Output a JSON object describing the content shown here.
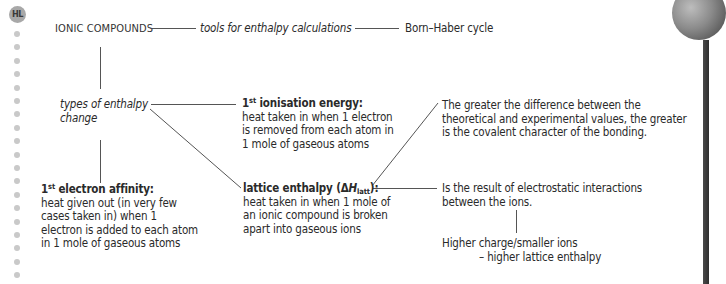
{
  "badge": {
    "label": "HL"
  },
  "margin_dots": {
    "count": 19
  },
  "diagram": {
    "root": {
      "label": "IONIC COMPOUNDS"
    },
    "tools": {
      "label": "tools for enthalpy calculations"
    },
    "born_haber": {
      "label": "Born–Haber cycle"
    },
    "types": {
      "line1": "types of enthalpy",
      "line2": "change"
    },
    "ionisation": {
      "title_num": "1",
      "title_sup": "st",
      "title_rest": " ionisation energy:",
      "lines": [
        "heat taken in when 1 electron",
        "is removed from each atom in",
        "1 mole of gaseous atoms"
      ]
    },
    "electron_affinity": {
      "title_num": "1",
      "title_sup": "st",
      "title_rest": " electron affinity:",
      "lines": [
        "heat given out (in very few",
        "cases taken in) when 1",
        "electron is added to each atom",
        "in 1 mole of gaseous atoms"
      ]
    },
    "lattice": {
      "title_pre": "lattice enthalpy (Δ",
      "title_H": "H",
      "title_sub": "latt",
      "title_post": "):",
      "lines": [
        "heat taken in when 1 mole of",
        "an ionic compound is broken",
        "apart into gaseous ions"
      ]
    },
    "covalent_note": {
      "lines": [
        "The greater the difference between the",
        "theoretical and experimental values, the greater",
        "is the covalent character of the bonding."
      ]
    },
    "electrostatic_note": {
      "lines": [
        "Is the result of electrostatic interactions",
        "between the ions."
      ]
    },
    "higher_charge_note": {
      "line1": "Higher charge/smaller ions",
      "line2": "– higher lattice enthalpy"
    }
  },
  "colors": {
    "text": "#2a2a2a",
    "line": "#555555",
    "badge_bg": "#a8a8a8",
    "dot": "#c9c9c9",
    "edge_bar": "#3a3a3a"
  }
}
